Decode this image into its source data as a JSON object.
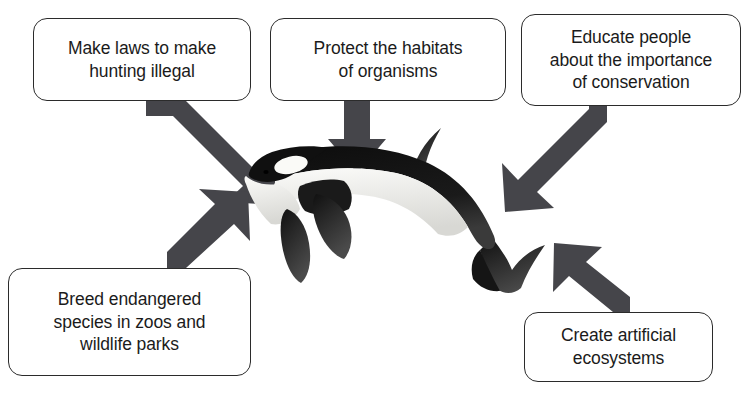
{
  "diagram": {
    "center_subject": "killer-whale-orca",
    "center_subject_label": "Orca (killer whale)",
    "colors": {
      "arrow": "#45454a",
      "box_border": "#2b2b2b",
      "box_fill": "#ffffff",
      "text": "#1b1b1b",
      "whale_body": "#121212",
      "whale_belly": "#f2f2ef",
      "background": "#ffffff"
    },
    "boxes": [
      {
        "id": "laws",
        "lines": [
          "Make laws to make",
          "hunting illegal"
        ],
        "arrow": "arrow-down-right"
      },
      {
        "id": "habitats",
        "lines": [
          "Protect the habitats",
          "of organisms"
        ],
        "arrow": "arrow-down"
      },
      {
        "id": "educate",
        "lines": [
          "Educate people",
          "about the importance",
          "of conservation"
        ],
        "arrow": "arrow-down-left"
      },
      {
        "id": "breed",
        "lines": [
          "Breed endangered",
          "species in zoos and",
          "wildlife parks"
        ],
        "arrow": "arrow-up-right"
      },
      {
        "id": "ecosystem",
        "lines": [
          "Create artificial",
          "ecosystems"
        ],
        "arrow": "arrow-up-left"
      }
    ]
  }
}
